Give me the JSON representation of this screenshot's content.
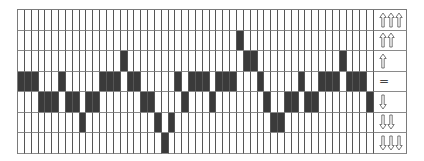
{
  "diagram": {
    "columns": 52,
    "rows": [
      {
        "label": "up-3",
        "symbol": "⇧⇧⇧",
        "arrows": 3,
        "direction": "up"
      },
      {
        "label": "up-2",
        "symbol": "⇧⇧",
        "arrows": 2,
        "direction": "up"
      },
      {
        "label": "up-1",
        "symbol": "⇧",
        "arrows": 1,
        "direction": "up"
      },
      {
        "label": "equal",
        "symbol": "=",
        "arrows": 0,
        "direction": "none"
      },
      {
        "label": "down-1",
        "symbol": "⇩",
        "arrows": 1,
        "direction": "down"
      },
      {
        "label": "down-2",
        "symbol": "⇩⇩",
        "arrows": 2,
        "direction": "down"
      },
      {
        "label": "down-3",
        "symbol": "⇩⇩⇩",
        "arrows": 3,
        "direction": "down"
      }
    ],
    "filled_row_per_column": [
      3,
      3,
      3,
      4,
      4,
      4,
      3,
      4,
      4,
      5,
      4,
      4,
      3,
      3,
      3,
      2,
      3,
      3,
      4,
      4,
      5,
      6,
      5,
      3,
      4,
      3,
      3,
      3,
      4,
      3,
      3,
      3,
      1,
      2,
      2,
      3,
      4,
      5,
      5,
      4,
      4,
      3,
      4,
      4,
      3,
      3,
      3,
      2,
      3,
      3,
      3,
      4
    ],
    "colors": {
      "filled": "#3a3a3a",
      "empty": "#ffffff",
      "line": "#6e6e6e"
    }
  }
}
